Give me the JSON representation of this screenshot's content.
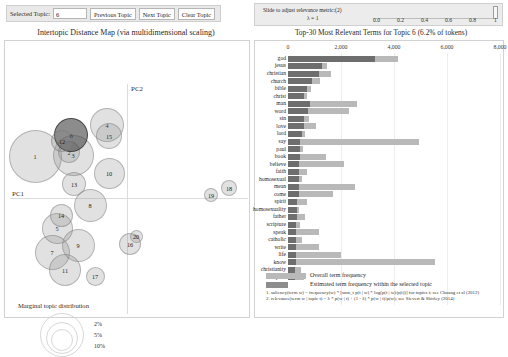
{
  "controls": {
    "selected_topic_label": "Selected Topic:",
    "selected_topic_value": "6",
    "previous_topic_label": "Previous Topic",
    "next_topic_label": "Next Topic",
    "clear_topic_label": "Clear Topic"
  },
  "lambda_control": {
    "instruction": "Slide to adjust relevance metric:(2)",
    "value_label": "λ = 1",
    "ticks": [
      "0.0",
      "0.2",
      "0.4",
      "0.6",
      "0.8",
      "1"
    ],
    "handle_position": 1.0
  },
  "left_panel": {
    "title": "Intertopic Distance Map (via multidimensional scaling)",
    "axis_x_label": "PC1",
    "axis_y_label": "PC2",
    "marginal_title": "Marginal topic distribution",
    "marginal_legend": [
      "2%",
      "5%",
      "10%"
    ],
    "selected_topic": 6,
    "topics": [
      {
        "id": 1,
        "x": 31,
        "y": 116,
        "r": 26.5
      },
      {
        "id": 2,
        "x": 65,
        "y": 112,
        "r": 11.0
      },
      {
        "id": 3,
        "x": 69,
        "y": 115,
        "r": 20.5
      },
      {
        "id": 4,
        "x": 103,
        "y": 85,
        "r": 17.0
      },
      {
        "id": 5,
        "x": 53,
        "y": 188,
        "r": 15.5
      },
      {
        "id": 6,
        "x": 67,
        "y": 95,
        "r": 17.0
      },
      {
        "id": 7,
        "x": 48,
        "y": 212,
        "r": 17.5
      },
      {
        "id": 8,
        "x": 86,
        "y": 165,
        "r": 16.5
      },
      {
        "id": 9,
        "x": 74,
        "y": 205,
        "r": 16.5
      },
      {
        "id": 10,
        "x": 105,
        "y": 133,
        "r": 15.5
      },
      {
        "id": 11,
        "x": 61,
        "y": 230,
        "r": 16.0
      },
      {
        "id": 12,
        "x": 58,
        "y": 101,
        "r": 11.0
      },
      {
        "id": 13,
        "x": 70,
        "y": 144,
        "r": 12.0
      },
      {
        "id": 14,
        "x": 57,
        "y": 175,
        "r": 11.5
      },
      {
        "id": 15,
        "x": 105,
        "y": 96,
        "r": 13.0
      },
      {
        "id": 16,
        "x": 126,
        "y": 204,
        "r": 11.0
      },
      {
        "id": 17,
        "x": 91,
        "y": 236,
        "r": 9.5
      },
      {
        "id": 18,
        "x": 225,
        "y": 148,
        "r": 8.0
      },
      {
        "id": 19,
        "x": 207,
        "y": 155,
        "r": 7.0
      },
      {
        "id": 20,
        "x": 132,
        "y": 196,
        "r": 6.5
      }
    ]
  },
  "right_panel": {
    "title": "Top-30 Most Relevant Terms for Topic 6 (6.2% of tokens)",
    "legend_overall": "Overall term frequency",
    "legend_topic": "Estimated term frequency within the selected topic",
    "footnote1": "1. saliency(term w) = frequency(w) * [sum_t p(t | w) * log(p(t | w)/p(t))] for topics t; see Chuang et al (2012)",
    "footnote2": "2. relevance(term w | topic t) = λ * p(w | t) + (1 - λ) * p(w | t)/p(w); see Sievert & Shirley (2014)"
  },
  "chart_data": {
    "type": "bar",
    "title": "Top-30 Most Relevant Terms for Topic 6 (6.2% of tokens)",
    "xlabel": "",
    "ylabel": "",
    "xlim": [
      0,
      8000
    ],
    "xticks": [
      0,
      2000,
      4000,
      6000,
      8000
    ],
    "grid": true,
    "legend_position": "bottom",
    "orientation": "horizontal",
    "categories": [
      "god",
      "jesus",
      "christian",
      "church",
      "bible",
      "christ",
      "man",
      "word",
      "sin",
      "love",
      "lord",
      "say",
      "paul",
      "book",
      "believe",
      "faith",
      "homosexual",
      "mean",
      "come",
      "spirit",
      "homosexuality",
      "father",
      "scripture",
      "speak",
      "catholic",
      "write",
      "life",
      "know",
      "christianity",
      "john"
    ],
    "series": [
      {
        "name": "Overall term frequency",
        "values": [
          4150,
          1490,
          1640,
          1190,
          880,
          700,
          2600,
          2320,
          800,
          1050,
          640,
          4950,
          560,
          1450,
          2100,
          720,
          520,
          2530,
          1700,
          720,
          420,
          640,
          450,
          1180,
          540,
          1180,
          2000,
          5560,
          480,
          600
        ]
      },
      {
        "name": "Estimated term frequency within the selected topic",
        "values": [
          3300,
          1300,
          1170,
          920,
          700,
          620,
          840,
          770,
          620,
          590,
          520,
          470,
          470,
          470,
          430,
          420,
          410,
          400,
          400,
          340,
          340,
          330,
          320,
          320,
          310,
          300,
          300,
          290,
          280,
          270
        ]
      }
    ]
  }
}
